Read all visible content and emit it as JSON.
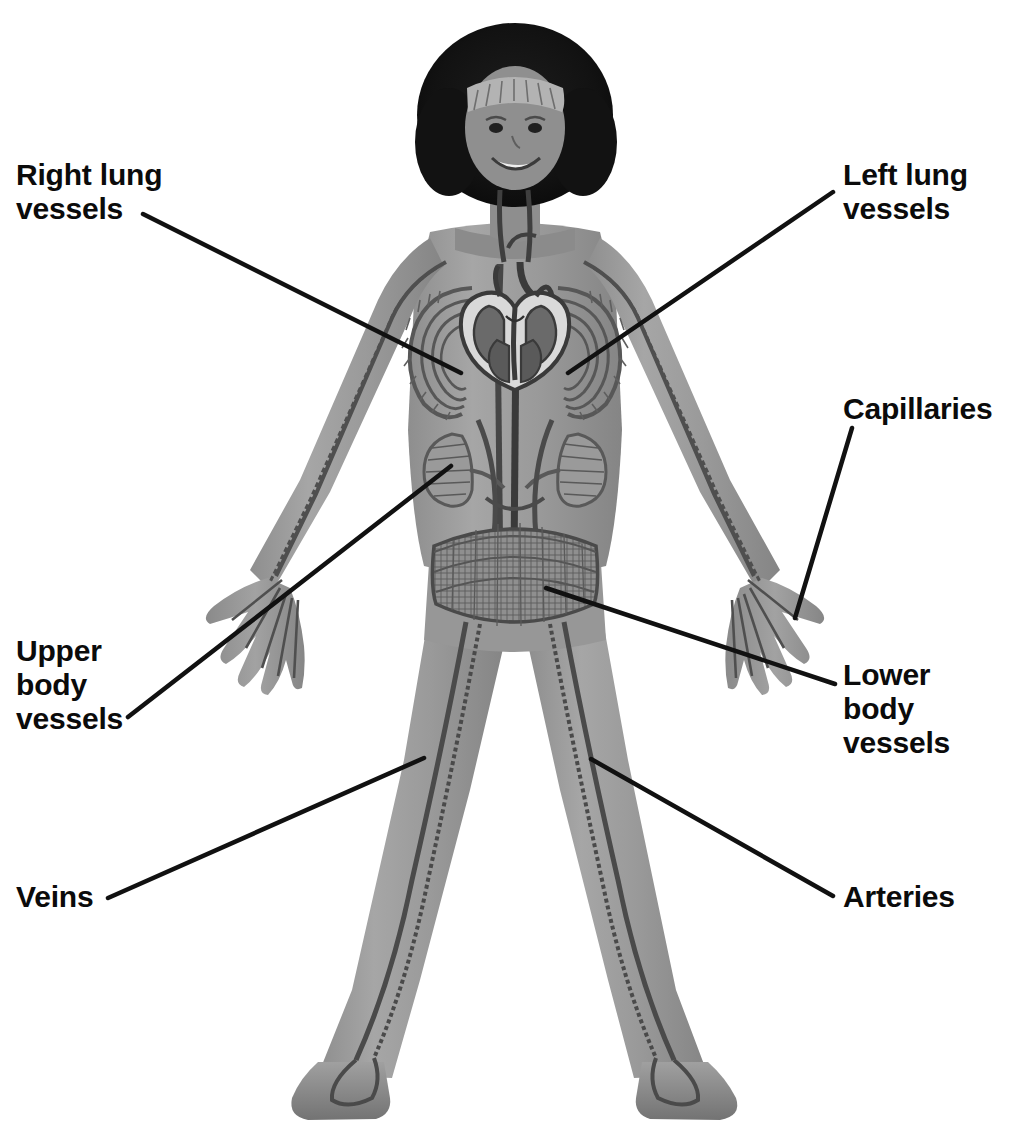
{
  "diagram": {
    "figure": "smiling girl standing with arms outstretched, circulatory system overlaid on body",
    "background_color": "#ffffff",
    "line_color": "#111111",
    "text_color": "#0b0b0b",
    "body_color": "#9b9b9b",
    "vessel_color": "#4a4a4a",
    "hair_color": "#141414"
  },
  "labels": {
    "right_lung_vessels": "Right lung\nvessels",
    "left_lung_vessels": "Left lung\nvessels",
    "capillaries": "Capillaries",
    "upper_body_vessels": "Upper\nbody\nvessels",
    "lower_body_vessels": "Lower\nbody\nvessels",
    "veins": "Veins",
    "arteries": "Arteries"
  },
  "leader_lines": [
    {
      "name": "right-lung-vessels-leader",
      "x1": 143,
      "y1": 214,
      "x2": 461,
      "y2": 373
    },
    {
      "name": "left-lung-vessels-leader",
      "x1": 833,
      "y1": 192,
      "x2": 568,
      "y2": 373
    },
    {
      "name": "capillaries-leader",
      "x1": 852,
      "y1": 428,
      "x2": 795,
      "y2": 618
    },
    {
      "name": "upper-body-vessels-leader",
      "x1": 128,
      "y1": 717,
      "x2": 451,
      "y2": 466
    },
    {
      "name": "lower-body-vessels-leader",
      "x1": 835,
      "y1": 684,
      "x2": 546,
      "y2": 588
    },
    {
      "name": "veins-leader",
      "x1": 108,
      "y1": 898,
      "x2": 424,
      "y2": 758
    },
    {
      "name": "arteries-leader",
      "x1": 833,
      "y1": 896,
      "x2": 591,
      "y2": 759
    }
  ],
  "anatomy_parts": [
    "head",
    "hair",
    "headband",
    "face",
    "neck",
    "torso",
    "shirt",
    "right-arm",
    "left-arm",
    "right-hand",
    "left-hand",
    "right-leg",
    "left-leg",
    "trousers",
    "right-shoe",
    "left-shoe",
    "heart-cross-section",
    "right-lung-vessel-network",
    "left-lung-vessel-network",
    "aorta",
    "vena-cava",
    "kidney-vessels",
    "abdominal-capillary-band",
    "arm-arteries",
    "arm-veins",
    "leg-arteries",
    "leg-veins"
  ]
}
